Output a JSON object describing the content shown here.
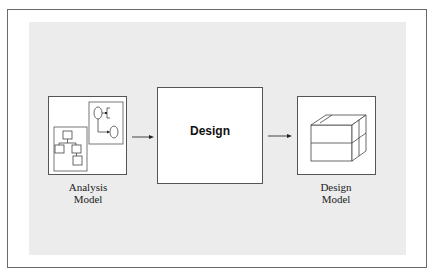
{
  "diagram": {
    "nodes": [
      {
        "id": "analysis-model",
        "caption_line1": "Analysis",
        "caption_line2": "Model",
        "icon": "analysis-diagrams-icon"
      },
      {
        "id": "design",
        "label": "Design"
      },
      {
        "id": "design-model",
        "caption_line1": "Design",
        "caption_line2": "Model",
        "icon": "cube-icon"
      }
    ],
    "edges": [
      {
        "from": "analysis-model",
        "to": "design"
      },
      {
        "from": "design",
        "to": "design-model"
      }
    ],
    "colors": {
      "panel": "#ececec",
      "border": "#555555",
      "frame": "#6a6a6a"
    }
  }
}
